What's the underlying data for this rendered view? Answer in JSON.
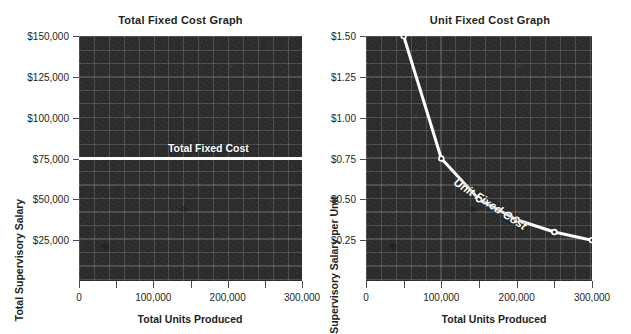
{
  "figure": {
    "background_color": "#ffffff",
    "plot_background_color": "#2b2b2b",
    "series_color": "#ffffff",
    "text_color": "#231f20"
  },
  "charts": [
    {
      "title": "Total Fixed Cost Graph",
      "xlabel": "Total Units Produced",
      "ylabel": "Total Supervisory Salary",
      "series_label": "Total Fixed Cost",
      "ytick_labels": [
        "$150,000",
        "$125,000",
        "$100,000",
        "$75,000",
        "$50,000",
        "$25,000"
      ],
      "xtick_labels": [
        "0",
        "100,000",
        "200,000",
        "300,000"
      ]
    },
    {
      "title": "Unit Fixed Cost Graph",
      "xlabel": "Total Units Produced",
      "ylabel": "Supervisory Salary per Unit",
      "series_label": "Unit Fixed Cost",
      "ytick_labels": [
        "$1.50",
        "$1.25",
        "$1.00",
        "$0.75",
        "$0.50",
        "$0.25"
      ],
      "xtick_labels": [
        "0",
        "100,000",
        "200,000",
        "300,000"
      ]
    }
  ],
  "chart_data": [
    {
      "type": "line",
      "title": "Total Fixed Cost Graph",
      "xlabel": "Total Units Produced",
      "ylabel": "Total Supervisory Salary",
      "series": [
        {
          "name": "Total Fixed Cost",
          "x": [
            0,
            300000
          ],
          "values": [
            75000,
            75000
          ]
        }
      ],
      "xlim": [
        0,
        300000
      ],
      "ylim": [
        0,
        150000
      ],
      "xticks": [
        0,
        50000,
        100000,
        150000,
        200000,
        250000,
        300000
      ],
      "xtick_labels": [
        "0",
        "",
        "100,000",
        "",
        "200,000",
        "",
        "300,000"
      ],
      "yticks": [
        25000,
        50000,
        75000,
        100000,
        125000,
        150000
      ],
      "ytick_labels": [
        "$25,000",
        "$50,000",
        "$75,000",
        "$100,000",
        "$125,000",
        "$150,000"
      ],
      "grid": true,
      "legend": "inline-label",
      "annotations": [
        "Total Fixed Cost"
      ]
    },
    {
      "type": "line",
      "title": "Unit Fixed Cost Graph",
      "xlabel": "Total Units Produced",
      "ylabel": "Supervisory Salary per Unit",
      "series": [
        {
          "name": "Unit Fixed Cost",
          "x": [
            50000,
            100000,
            150000,
            200000,
            250000,
            300000
          ],
          "values": [
            1.5,
            0.75,
            0.5,
            0.375,
            0.3,
            0.25
          ],
          "markers": true
        }
      ],
      "xlim": [
        0,
        300000
      ],
      "ylim": [
        0,
        1.5
      ],
      "xticks": [
        0,
        50000,
        100000,
        150000,
        200000,
        250000,
        300000
      ],
      "xtick_labels": [
        "0",
        "",
        "100,000",
        "",
        "200,000",
        "",
        "300,000"
      ],
      "yticks": [
        0.25,
        0.5,
        0.75,
        1.0,
        1.25,
        1.5
      ],
      "ytick_labels": [
        "$0.25",
        "$0.50",
        "$0.75",
        "$1.00",
        "$1.25",
        "$1.50"
      ],
      "grid": true,
      "legend": "inline-label",
      "annotations": [
        "Unit Fixed Cost"
      ]
    }
  ]
}
